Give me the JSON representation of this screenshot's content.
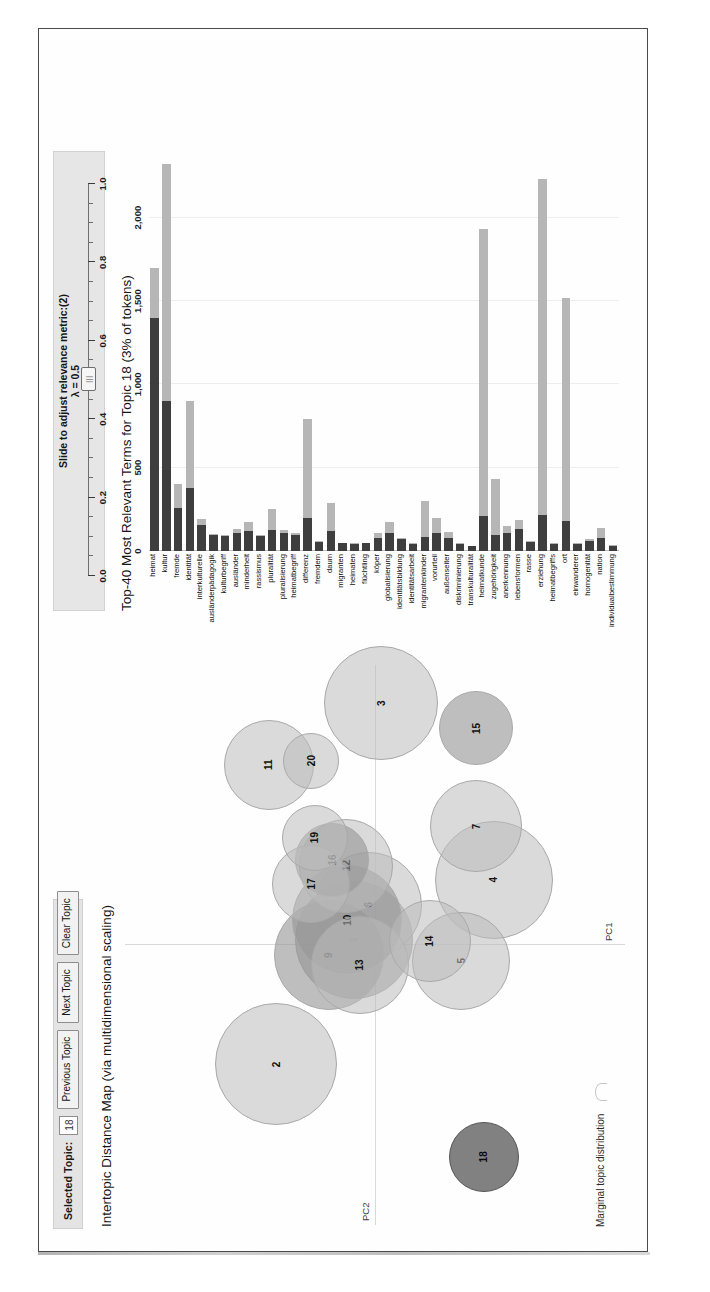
{
  "app": {
    "name": "LDAvis",
    "type": "topic-model-visualization"
  },
  "controls": {
    "selected_topic_label": "Selected Topic:",
    "selected_topic_value": "18",
    "previous_topic": "Previous Topic",
    "next_topic": "Next Topic",
    "clear_topic": "Clear Topic"
  },
  "slider": {
    "caption": "Slide to adjust relevance metric:(2)",
    "lambda_text": "λ = 0.5",
    "value": 0.5,
    "min": 0.0,
    "max": 1.0,
    "tick_labels": [
      "0.0",
      "0.2",
      "0.4",
      "0.6",
      "0.8",
      "1.0"
    ],
    "handle_glyph": "|||"
  },
  "left_panel": {
    "title": "Intertopic Distance Map (via multidimensional scaling)",
    "x_axis_label": "PC1",
    "y_axis_label": "PC2",
    "marginal_label": "Marginal topic distribution"
  },
  "right_panel": {
    "title": "Top-40 Most Relevant Terms for Topic 18 (3% of tokens)",
    "topic_number": 18,
    "token_share": "3%"
  },
  "chart_data": [
    {
      "type": "scatter",
      "title": "Intertopic Distance Map (via multidimensional scaling)",
      "xlabel": "PC1",
      "ylabel": "PC2",
      "grid": true,
      "legend": "Marginal topic distribution",
      "selected": 18,
      "xlim": [
        -1,
        1
      ],
      "ylim": [
        -1,
        1
      ],
      "points": [
        {
          "topic": 1,
          "x": 0.015,
          "y": 0.09,
          "r": 58,
          "state": "mid"
        },
        {
          "topic": 2,
          "x": -0.43,
          "y": 0.4,
          "r": 60,
          "state": "normal"
        },
        {
          "topic": 3,
          "x": 0.86,
          "y": -0.02,
          "r": 56,
          "state": "normal"
        },
        {
          "topic": 4,
          "x": 0.23,
          "y": -0.47,
          "r": 58,
          "state": "normal"
        },
        {
          "topic": 5,
          "x": -0.06,
          "y": -0.34,
          "r": 48,
          "state": "normal"
        },
        {
          "topic": 6,
          "x": 0.14,
          "y": 0.03,
          "r": 52,
          "state": "normal"
        },
        {
          "topic": 7,
          "x": 0.42,
          "y": -0.4,
          "r": 45,
          "state": "normal"
        },
        {
          "topic": 9,
          "x": -0.04,
          "y": 0.19,
          "r": 54,
          "state": "mid"
        },
        {
          "topic": 10,
          "x": 0.085,
          "y": 0.115,
          "r": 54,
          "state": "mid"
        },
        {
          "topic": 11,
          "x": 0.64,
          "y": 0.43,
          "r": 44,
          "state": "normal"
        },
        {
          "topic": 12,
          "x": 0.28,
          "y": 0.12,
          "r": 46,
          "state": "normal"
        },
        {
          "topic": 13,
          "x": -0.075,
          "y": 0.065,
          "r": 48,
          "state": "normal"
        },
        {
          "topic": 14,
          "x": 0.01,
          "y": -0.215,
          "r": 40,
          "state": "normal"
        },
        {
          "topic": 16,
          "x": 0.3,
          "y": 0.175,
          "r": 36,
          "state": "mid"
        },
        {
          "topic": 17,
          "x": 0.215,
          "y": 0.26,
          "r": 38,
          "state": "normal"
        },
        {
          "topic": 18,
          "x": -0.76,
          "y": -0.43,
          "r": 34,
          "state": "selected"
        },
        {
          "topic": 19,
          "x": 0.38,
          "y": 0.245,
          "r": 32,
          "state": "normal"
        },
        {
          "topic": 15,
          "x": 0.77,
          "y": -0.4,
          "r": 36,
          "state": "mid"
        },
        {
          "topic": 20,
          "x": 0.655,
          "y": 0.26,
          "r": 27,
          "state": "normal"
        }
      ]
    },
    {
      "type": "bar",
      "orientation": "horizontal",
      "stacked": true,
      "title": "Top-40 Most Relevant Terms for Topic 18 (3% of tokens)",
      "xlabel": "",
      "ylabel": "",
      "xlim": [
        0,
        2400
      ],
      "xticks": [
        0,
        500,
        1000,
        1500,
        2000
      ],
      "xtick_labels": [
        "0",
        "500",
        "1,000",
        "1,500",
        "2,000"
      ],
      "series": [
        {
          "name": "Overall term frequency",
          "color": "#b6b6b6"
        },
        {
          "name": "Estimated term frequency within the selected topic",
          "color": "#3e3e3e"
        }
      ],
      "categories": [
        "heimat",
        "kultur",
        "fremde",
        "identität",
        "interkulturelle",
        "ausländerpädagogik",
        "kulturbegriff",
        "ausländer",
        "minderheit",
        "rassismus",
        "pluralität",
        "pluralisierung",
        "heimatbegriff",
        "differenz",
        "fremdem",
        "daum",
        "migranten",
        "heimaten",
        "flüchtling",
        "köper",
        "globalisierung",
        "identitätsbildung",
        "identitätsarbeit",
        "migrantenkinder",
        "vorurteil",
        "außenseiter",
        "diskriminierung",
        "transkulturalität",
        "heimatkunde",
        "zugehörigkeit",
        "anerkennung",
        "lebensformen",
        "rasse",
        "erziehung",
        "heimatbegriffs",
        "ort",
        "einwanderer",
        "homogenität",
        "nation",
        "individualbestimmung"
      ],
      "overall_frequency": [
        1700,
        2320,
        400,
        900,
        190,
        100,
        95,
        130,
        175,
        95,
        250,
        125,
        110,
        790,
        60,
        290,
        50,
        45,
        50,
        105,
        175,
        80,
        45,
        300,
        200,
        115,
        45,
        30,
        1930,
        430,
        150,
        185,
        60,
        2230,
        45,
        1520,
        45,
        70,
        140,
        35
      ],
      "topic_frequency": [
        1400,
        900,
        255,
        380,
        155,
        95,
        90,
        105,
        120,
        90,
        125,
        105,
        95,
        195,
        55,
        120,
        45,
        40,
        45,
        80,
        105,
        70,
        40,
        85,
        105,
        80,
        40,
        28,
        210,
        95,
        110,
        130,
        55,
        215,
        40,
        180,
        40,
        60,
        75,
        30
      ]
    }
  ]
}
